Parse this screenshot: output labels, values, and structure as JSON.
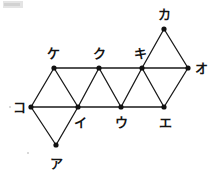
{
  "figure": {
    "type": "geometry-diagram",
    "width": 212,
    "height": 176,
    "background_color": "#ffffff",
    "stroke_color": "#1a1a1a",
    "node_fill_color": "#111111",
    "stroke_width": 1.3,
    "node_radius": 2.6
  },
  "nodes": [
    {
      "id": "a",
      "label": "ア",
      "x": 56,
      "y": 145,
      "label_x": 56,
      "label_y": 163
    },
    {
      "id": "i",
      "label": "イ",
      "x": 78,
      "y": 107,
      "label_x": 80,
      "label_y": 122
    },
    {
      "id": "u",
      "label": "ウ",
      "x": 121,
      "y": 107,
      "label_x": 121,
      "label_y": 122
    },
    {
      "id": "e",
      "label": "エ",
      "x": 164,
      "y": 107,
      "label_x": 165,
      "label_y": 122
    },
    {
      "id": "o",
      "label": "オ",
      "x": 188,
      "y": 68,
      "label_x": 201,
      "label_y": 68
    },
    {
      "id": "ka",
      "label": "カ",
      "x": 164,
      "y": 29,
      "label_x": 164,
      "label_y": 14
    },
    {
      "id": "ki",
      "label": "キ",
      "x": 142,
      "y": 68,
      "label_x": 140,
      "label_y": 53
    },
    {
      "id": "ku",
      "label": "ク",
      "x": 99,
      "y": 68,
      "label_x": 99,
      "label_y": 53
    },
    {
      "id": "ke",
      "label": "ケ",
      "x": 54,
      "y": 68,
      "label_x": 53,
      "label_y": 53
    },
    {
      "id": "ko",
      "label": "コ",
      "x": 31,
      "y": 107,
      "label_x": 19,
      "label_y": 107
    }
  ],
  "edges": [
    {
      "from": "ke",
      "to": "ku",
      "kind": "horizontal-top"
    },
    {
      "from": "ku",
      "to": "ki",
      "kind": "horizontal-top"
    },
    {
      "from": "ki",
      "to": "o",
      "kind": "horizontal-top"
    },
    {
      "from": "ko",
      "to": "i",
      "kind": "horizontal-middle"
    },
    {
      "from": "i",
      "to": "u",
      "kind": "horizontal-middle"
    },
    {
      "from": "u",
      "to": "e",
      "kind": "horizontal-middle"
    },
    {
      "from": "ke",
      "to": "ko",
      "kind": "diagonal"
    },
    {
      "from": "ke",
      "to": "i",
      "kind": "diagonal"
    },
    {
      "from": "ku",
      "to": "i",
      "kind": "diagonal"
    },
    {
      "from": "ku",
      "to": "u",
      "kind": "diagonal"
    },
    {
      "from": "ki",
      "to": "u",
      "kind": "diagonal"
    },
    {
      "from": "ki",
      "to": "e",
      "kind": "diagonal"
    },
    {
      "from": "o",
      "to": "e",
      "kind": "diagonal"
    },
    {
      "from": "ka",
      "to": "ki",
      "kind": "diagonal"
    },
    {
      "from": "ka",
      "to": "o",
      "kind": "diagonal"
    },
    {
      "from": "ko",
      "to": "a",
      "kind": "diagonal"
    },
    {
      "from": "i",
      "to": "a",
      "kind": "diagonal"
    }
  ],
  "specks": [
    {
      "x": 9,
      "y": 106
    },
    {
      "x": 27,
      "y": 152
    }
  ]
}
